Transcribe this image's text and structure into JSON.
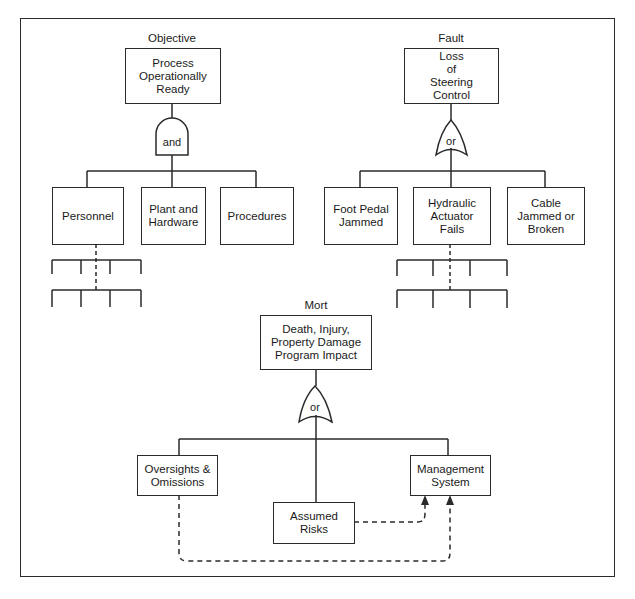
{
  "diagram": {
    "type": "fault-tree comparison",
    "trees": {
      "objective": {
        "caption": "Objective",
        "top_event": "Process\nOperationally\nReady",
        "gate": "and",
        "children": [
          "Personnel",
          "Plant and\nHardware",
          "Procedures"
        ]
      },
      "fault": {
        "caption": "Fault",
        "top_event": "Loss\nof\nSteering\nControl",
        "gate": "or",
        "children": [
          "Foot Pedal\nJammed",
          "Hydraulic\nActuator\nFails",
          "Cable\nJammed or\nBroken"
        ]
      },
      "mort": {
        "caption": "Mort",
        "top_event": "Death, Injury,\nProperty Damage\nProgram Impact",
        "gate": "or",
        "children": [
          "Oversights &\nOmissions",
          "Assumed\nRisks",
          "Management\nSystem"
        ]
      }
    },
    "line_color": "#2a2a2a"
  }
}
